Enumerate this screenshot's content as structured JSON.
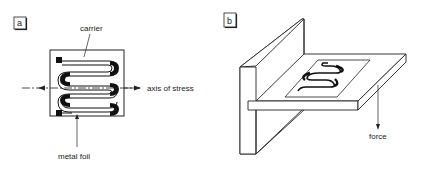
{
  "panels": [
    {
      "id": "a",
      "label": "a",
      "title": "Strain gauge (top view)",
      "annotations": {
        "carrier": "carrier",
        "axis": "axis of stress",
        "foil": "metal foil"
      }
    },
    {
      "id": "b",
      "label": "b",
      "title": "Strain gauge mounted on cantilever",
      "annotations": {
        "force": "force"
      }
    }
  ],
  "colors": {
    "line": "#222222",
    "fill": "#111111",
    "background": "#ffffff"
  }
}
